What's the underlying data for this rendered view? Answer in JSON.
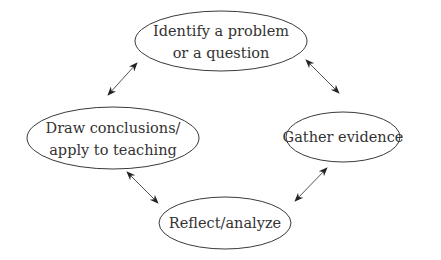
{
  "diagram": {
    "type": "cycle",
    "nodes": [
      {
        "id": "identify",
        "lines": [
          "Identify a problem",
          "or a question"
        ],
        "cx": 221,
        "cy": 41,
        "rx": 86,
        "ry": 30
      },
      {
        "id": "gather",
        "lines": [
          "Gather evidence"
        ],
        "cx": 343,
        "cy": 137,
        "rx": 57,
        "ry": 25
      },
      {
        "id": "reflect",
        "lines": [
          "Reflect/analyze"
        ],
        "cx": 225,
        "cy": 223,
        "rx": 66,
        "ry": 26
      },
      {
        "id": "conclude",
        "lines": [
          "Draw conclusions/",
          "apply to teaching"
        ],
        "cx": 113,
        "cy": 138,
        "rx": 86,
        "ry": 31
      }
    ],
    "edges": [
      {
        "from": "identify",
        "to": "gather",
        "bidirectional": true,
        "x1": 306,
        "y1": 60,
        "x2": 339,
        "y2": 93
      },
      {
        "from": "gather",
        "to": "reflect",
        "bidirectional": true,
        "x1": 327,
        "y1": 168,
        "x2": 295,
        "y2": 201
      },
      {
        "from": "reflect",
        "to": "conclude",
        "bidirectional": true,
        "x1": 158,
        "y1": 203,
        "x2": 127,
        "y2": 172
      },
      {
        "from": "conclude",
        "to": "identify",
        "bidirectional": true,
        "x1": 108,
        "y1": 95,
        "x2": 137,
        "y2": 63
      }
    ],
    "rule": {
      "x1": 150,
      "x2": 432,
      "y": 258
    }
  }
}
